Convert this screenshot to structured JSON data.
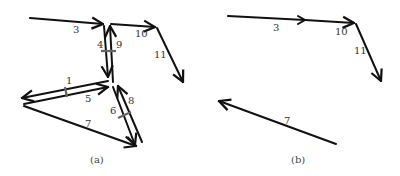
{
  "panels": [
    {
      "id": "a",
      "caption": "(a)",
      "edges": [
        {
          "label": "3",
          "from": [
            30,
            18
          ],
          "to": [
            103,
            24
          ],
          "arrow": "end",
          "label_pos": [
            74,
            33
          ]
        },
        {
          "label": "4",
          "from": [
            104,
            26
          ],
          "to": [
            108,
            77
          ],
          "arrow": "end",
          "label_pos": [
            98,
            48
          ]
        },
        {
          "label": "9",
          "from": [
            113,
            82
          ],
          "to": [
            110,
            26
          ],
          "arrow": "end",
          "label_pos": [
            117,
            48
          ]
        },
        {
          "label": "10",
          "from": [
            111,
            24
          ],
          "to": [
            155,
            27
          ],
          "arrow": "end",
          "label_pos": [
            136,
            37
          ]
        },
        {
          "label": "11",
          "from": [
            157,
            28
          ],
          "to": [
            183,
            82
          ],
          "arrow": "end",
          "label_pos": [
            155,
            58
          ]
        },
        {
          "label": "1",
          "from": [
            108,
            81
          ],
          "to": [
            22,
            98
          ],
          "arrow": "end",
          "label_pos": [
            68,
            84
          ]
        },
        {
          "label": "5",
          "from": [
            24,
            104
          ],
          "to": [
            108,
            87
          ],
          "arrow": "end",
          "label_pos": [
            86,
            102
          ]
        },
        {
          "label": "6",
          "from": [
            113,
            87
          ],
          "to": [
            135,
            145
          ],
          "arrow": "end",
          "label_pos": [
            111,
            113
          ]
        },
        {
          "label": "8",
          "from": [
            142,
            142
          ],
          "to": [
            118,
            86
          ],
          "arrow": "end",
          "label_pos": [
            128,
            104
          ]
        },
        {
          "label": "7",
          "from": [
            24,
            106
          ],
          "to": [
            136,
            146
          ],
          "arrow": "end",
          "label_pos": [
            86,
            126
          ]
        }
      ],
      "ticks": [
        {
          "on": "4-9",
          "at": [
            108,
            51
          ]
        },
        {
          "on": "1-5",
          "at": [
            66,
            92
          ]
        },
        {
          "on": "6-8",
          "at": [
            124,
            115
          ]
        }
      ]
    },
    {
      "id": "b",
      "caption": "(b)",
      "edges": [
        {
          "label": "3",
          "from": [
            228,
            16
          ],
          "to": [
            300,
            20
          ],
          "arrow": "mid",
          "label_pos": [
            274,
            31
          ]
        },
        {
          "label": "10",
          "from": [
            300,
            20
          ],
          "to": [
            354,
            23
          ],
          "arrow": "end",
          "label_pos": [
            336,
            35
          ]
        },
        {
          "label": "11",
          "from": [
            356,
            24
          ],
          "to": [
            381,
            81
          ],
          "arrow": "end",
          "label_pos": [
            355,
            53
          ]
        },
        {
          "label": "7",
          "from": [
            336,
            144
          ],
          "to": [
            219,
            101
          ],
          "arrow": "end",
          "label_pos": [
            285,
            125
          ]
        }
      ],
      "ticks": []
    }
  ],
  "captions": {
    "a": "(a)",
    "b": "(b)"
  },
  "colors": {
    "edge": "#111111",
    "tick": "#666666",
    "text": "#333333",
    "background": "#ffffff"
  }
}
